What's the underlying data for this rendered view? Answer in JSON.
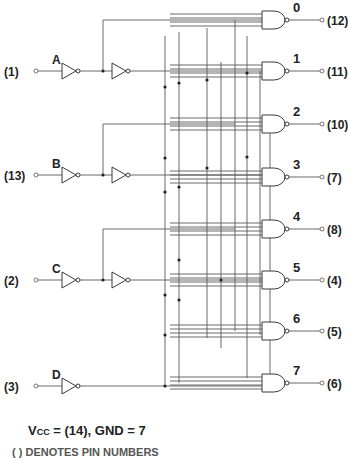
{
  "diagram": {
    "inputs": [
      {
        "name": "A",
        "pin": "(1)",
        "y": 71,
        "double_inverter": true
      },
      {
        "name": "B",
        "pin": "(13)",
        "y": 175,
        "double_inverter": true
      },
      {
        "name": "C",
        "pin": "(2)",
        "y": 280,
        "double_inverter": true
      },
      {
        "name": "D",
        "pin": "(3)",
        "y": 386,
        "double_inverter": false
      }
    ],
    "outputs": [
      {
        "label": "0",
        "pin": "(12)",
        "y": 20
      },
      {
        "label": "1",
        "pin": "(11)",
        "y": 71
      },
      {
        "label": "2",
        "pin": "(10)",
        "y": 124
      },
      {
        "label": "3",
        "pin": "(7)",
        "y": 177
      },
      {
        "label": "4",
        "pin": "(8)",
        "y": 229
      },
      {
        "label": "5",
        "pin": "(4)",
        "y": 280
      },
      {
        "label": "6",
        "pin": "(5)",
        "y": 331
      },
      {
        "label": "7",
        "pin": "(6)",
        "y": 383
      }
    ],
    "gate_type": "4-input NAND",
    "inverter_type": "NOT"
  },
  "footer": {
    "power": "V",
    "power_sub": "CC",
    "power_rest": " = (14), GND = 7",
    "note": "( ) DENOTES PIN NUMBERS"
  },
  "colors": {
    "line": "#5a5a5a",
    "text": "#222222",
    "background": "#ffffff"
  }
}
